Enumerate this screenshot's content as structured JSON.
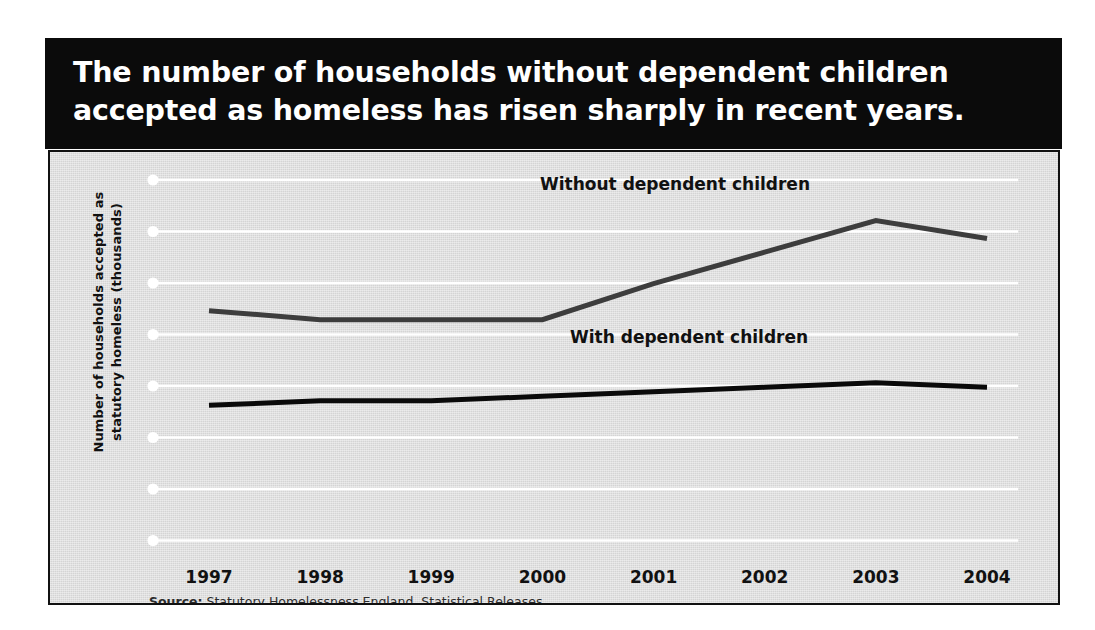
{
  "figure": {
    "title": "The number of households without dependent children\naccepted as homeless has risen sharply in recent years.",
    "title_background": "#0b0b0b",
    "title_color": "#ffffff",
    "plot_background": "#dcdcdc",
    "border_color": "#111111"
  },
  "source": {
    "prefix": "Source:",
    "text": " Statutory Homelessness England, Statistical Releases"
  },
  "chart_data": {
    "type": "line",
    "title": "The number of households without dependent children accepted as homeless has risen sharply in recent years.",
    "xlabel": "",
    "ylabel": "Number of households accepted as\nstatutory homeless (thousands)",
    "categories": [
      "1997",
      "1998",
      "1999",
      "2000",
      "2001",
      "2002",
      "2003",
      "2004"
    ],
    "x": [
      1997,
      1998,
      1999,
      2000,
      2001,
      2002,
      2003,
      2004
    ],
    "grid": true,
    "gridlines": 8,
    "grid_color": "#ffffff",
    "grid_marker": "white-dot",
    "legend_position": "inline-labels",
    "ylim": [
      0,
      80
    ],
    "yticks": [
      0,
      10,
      20,
      30,
      40,
      50,
      60,
      70
    ],
    "ytick_labels_visible": false,
    "series": [
      {
        "name": "Without dependent children",
        "color": "#3d3d3d",
        "linewidth": 5,
        "values": [
          51,
          49,
          49,
          49,
          57,
          64,
          71,
          67
        ]
      },
      {
        "name": "With dependent children",
        "color": "#0a0a0a",
        "linewidth": 5,
        "values": [
          30,
          31,
          31,
          32,
          33,
          34,
          35,
          34
        ]
      }
    ]
  },
  "axis": {
    "y_title": "Number of households accepted as\nstatutory homeless (thousands)"
  }
}
